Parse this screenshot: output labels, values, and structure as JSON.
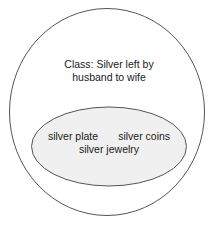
{
  "diagram": {
    "type": "euler-set-diagram",
    "outer_set": {
      "name": "class-circle",
      "label_line_1": "Class: Silver left by",
      "label_line_2": "husband to wife",
      "stroke_color": "#555555",
      "fill_color": "#ffffff"
    },
    "inner_set": {
      "name": "members-ellipse",
      "members": [
        "silver plate",
        "silver coins",
        "silver jewelry"
      ],
      "row_primary_left": "silver plate",
      "row_primary_right": "silver coins",
      "row_secondary": "silver jewelry",
      "stroke_color": "#555555",
      "fill_color": "#f0f0f0"
    },
    "text_color": "#1a1a1a",
    "background_color": "#ffffff"
  }
}
